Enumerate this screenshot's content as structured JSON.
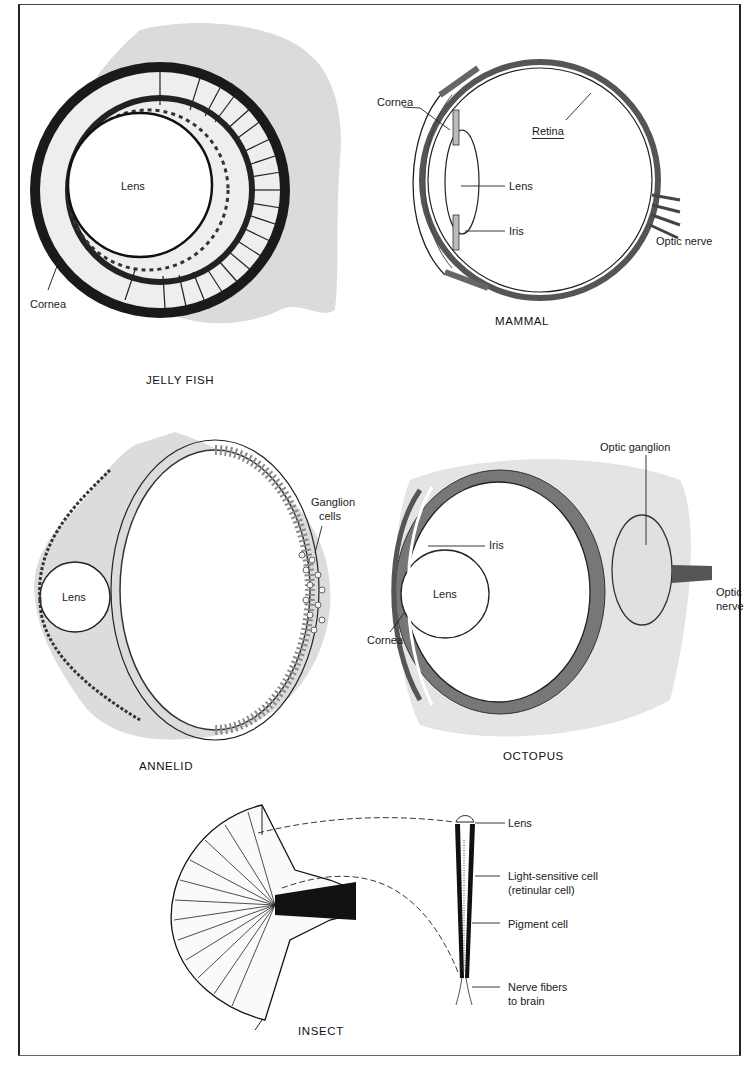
{
  "figure": {
    "panels": [
      {
        "id": "jellyfish",
        "title": "JELLY FISH",
        "labels": [
          "Lens",
          "Cornea"
        ]
      },
      {
        "id": "mammal",
        "title": "MAMMAL",
        "labels": [
          "Cornea",
          "Retina",
          "Lens",
          "Iris",
          "Optic nerve"
        ]
      },
      {
        "id": "annelid",
        "title": "ANNELID",
        "labels": [
          "Lens",
          "Ganglion",
          "cells"
        ]
      },
      {
        "id": "octopus",
        "title": "OCTOPUS",
        "labels": [
          "Optic ganglion",
          "Iris",
          "Lens",
          "Cornea",
          "Optic",
          "nerve"
        ]
      },
      {
        "id": "insect",
        "title": "INSECT",
        "labels": [
          "Lens",
          "Light-sensitive cell",
          "(retinular cell)",
          "Pigment cell",
          "Nerve fibers",
          "to brain"
        ]
      }
    ]
  }
}
